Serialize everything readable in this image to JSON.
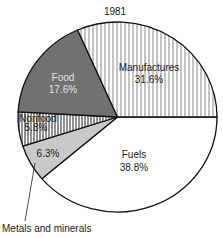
{
  "chart_data": {
    "type": "pie",
    "title": "1981",
    "start_angle_deg": 0,
    "direction": "clockwise",
    "slices": [
      {
        "label": "Fuels",
        "value": 38.8,
        "value_label": "38.8%",
        "fill": "#ffffff",
        "pattern": "none",
        "text_color": "#222222"
      },
      {
        "label": "Metals and minerals",
        "value": 6.3,
        "value_label": "6.3%",
        "fill": "#c9c9c9",
        "pattern": "none",
        "text_color": "#222222"
      },
      {
        "label": "Nonfood",
        "value": 5.8,
        "value_label": "5.8%",
        "fill": "#ffffff",
        "pattern": "vertical-lines-dense",
        "text_color": "#222222"
      },
      {
        "label": "Food",
        "value": 17.6,
        "value_label": "17.6%",
        "fill": "#717171",
        "pattern": "none",
        "text_color": "#e2e2e2"
      },
      {
        "label": "Manufactures",
        "value": 31.6,
        "value_label": "31.6%",
        "fill": "#ffffff",
        "pattern": "vertical-lines",
        "text_color": "#222222"
      }
    ],
    "unit": "%",
    "legend": "none",
    "callouts": [
      {
        "slice": "Metals and minerals",
        "text": "Metals and minerals",
        "position": "bottom-left"
      }
    ]
  },
  "labels": {
    "title": "1981",
    "fuels_name": "Fuels",
    "fuels_value": "38.8%",
    "metals_value": "6.3%",
    "metals_callout": "Metals and minerals",
    "nonfood_name": "Nonfood",
    "nonfood_value": "5.8%",
    "food_name": "Food",
    "food_value": "17.6%",
    "manufactures_name": "Manufactures",
    "manufactures_value": "31.6%"
  }
}
